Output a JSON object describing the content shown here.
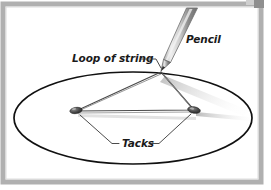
{
  "figure": {
    "labels": {
      "pencil": "Pencil",
      "loop_of_string": "Loop of string",
      "tacks": "Tacks"
    },
    "colors": {
      "frame": "#a8a8a8",
      "frame_inner": "#d6d6d6",
      "corner_mark": "#8f8f8f",
      "background": "#ffffff",
      "ellipse_stroke": "#111111",
      "string_stroke": "#555555",
      "pencil_body_light": "#e2e2e2",
      "pencil_body_mid": "#9a9a9a",
      "pencil_body_dark": "#6b6b6b",
      "pencil_tip": "#3a3a3a",
      "tack_head": "#4a4a4a",
      "tack_shadow": "#b9b9b9",
      "shadow": "#cfcfcf",
      "label_text": "#1a1a1a",
      "leader_line": "#333333"
    },
    "geometry": {
      "ellipse": {
        "cx": 133,
        "cy": 118,
        "rx": 119,
        "ry": 46
      },
      "tack_left": {
        "x": 75,
        "y": 111
      },
      "tack_right": {
        "x": 194,
        "y": 110
      },
      "pencil_point": {
        "x": 161,
        "y": 71
      },
      "pencil_top": {
        "x": 193,
        "y": 8
      }
    }
  }
}
